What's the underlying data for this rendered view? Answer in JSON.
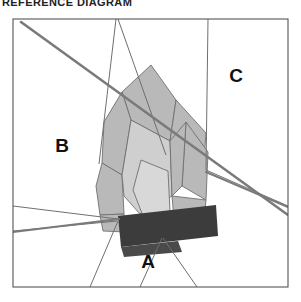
{
  "title": "REFERENCE DIAGRAM",
  "canvas": {
    "width": 301,
    "height": 302
  },
  "frame": {
    "x": 13,
    "y": 19,
    "width": 275,
    "height": 268,
    "stroke": "#555555",
    "stroke_width": 1.1,
    "fill": "#ffffff"
  },
  "colors": {
    "background": "#ffffff",
    "frame_stroke": "#555555",
    "thin_line": "#6f6f6f",
    "heavy_line": "#7a7a7a",
    "polygon_mid_gray": "#b9b9b9",
    "polygon_light_gray": "#d8d8d8",
    "polygon_pale_gray": "#cfcfcf",
    "band_dark": "#3c3c3c",
    "band_dark_alt": "#4a4a4a",
    "label_text": "#111111",
    "title_text": "#222222"
  },
  "labels": [
    {
      "id": "region-a",
      "text": "A",
      "x": 148,
      "y": 268,
      "font_size": 19
    },
    {
      "id": "region-b",
      "text": "B",
      "x": 62,
      "y": 152,
      "font_size": 19
    },
    {
      "id": "region-c",
      "text": "C",
      "x": 236,
      "y": 82,
      "font_size": 19
    }
  ],
  "partition_lines": [
    {
      "id": "divider-upper-right-vertical",
      "points": "208,19 206,170",
      "stroke": "#6f6f6f",
      "width": 1
    },
    {
      "id": "divider-left-mid",
      "points": "13,206 118,219",
      "stroke": "#6f6f6f",
      "width": 1
    },
    {
      "id": "divider-left-lower",
      "points": "13,231 117,221",
      "stroke": "#6f6f6f",
      "width": 1
    },
    {
      "id": "divider-bottom-left-diagonal",
      "points": "118,221 90,287",
      "stroke": "#6f6f6f",
      "width": 1
    },
    {
      "id": "divider-bottom-mid-diagonal",
      "points": "162,238 140,287",
      "stroke": "#6f6f6f",
      "width": 1
    },
    {
      "id": "divider-bottom-right-diagonal",
      "points": "163,238 197,287",
      "stroke": "#6f6f6f",
      "width": 1
    },
    {
      "id": "divider-upper-center-left",
      "points": "116,19 99,164",
      "stroke": "#6f6f6f",
      "width": 1
    },
    {
      "id": "divider-upper-center-right",
      "points": "118,19 166,155",
      "stroke": "#6f6f6f",
      "width": 1
    },
    {
      "id": "divider-right-lower",
      "points": "206,170 288,206",
      "stroke": "#6f6f6f",
      "width": 1
    }
  ],
  "polygons": [
    {
      "id": "shard-top-spire",
      "fill": "#b9b9b9",
      "points": "151,65 176,100 170,141 131,120 122,92"
    },
    {
      "id": "shard-upper-right-wing",
      "fill": "#b9b9b9",
      "points": "176,100 206,133 203,172 170,141"
    },
    {
      "id": "shard-right-tall",
      "fill": "#b9b9b9",
      "points": "186,122 208,152 206,200 182,186"
    },
    {
      "id": "shard-left-mid",
      "fill": "#b9b9b9",
      "points": "122,92 131,120 122,175 102,163 104,122"
    },
    {
      "id": "shard-left-lower",
      "fill": "#b9b9b9",
      "points": "102,163 122,175 124,214 100,215 96,186"
    },
    {
      "id": "shard-center-core",
      "fill": "#cfcfcf",
      "points": "131,120 170,141 172,196 140,214 124,196 122,175"
    },
    {
      "id": "shard-center-bright",
      "fill": "#d8d8d8",
      "points": "141,160 168,171 170,211 143,216 133,190"
    },
    {
      "id": "shard-right-low-wedge",
      "fill": "#b9b9b9",
      "points": "172,196 206,200 204,221 174,219"
    },
    {
      "id": "shard-lower-left-foot",
      "fill": "#b9b9b9",
      "points": "100,215 124,214 126,232 103,231"
    },
    {
      "id": "shard-mid-right-sliver",
      "fill": "#b9b9b9",
      "points": "170,141 186,122 182,186 172,196"
    }
  ],
  "band": {
    "id": "dark-horizontal-band",
    "fill": "#3c3c3c",
    "points": "118,216 216,205 218,236 121,247",
    "second_id": "dark-band-lower-tail",
    "second_fill": "#4a4a4a",
    "second_points": "121,247 178,241 182,252 124,257"
  },
  "heavy_lines": [
    {
      "id": "main-diagonal",
      "x1": 21,
      "y1": 22,
      "x2": 288,
      "y2": 215,
      "stroke": "#7a7a7a",
      "width": 2.6
    },
    {
      "id": "lower-left-connector",
      "x1": 13,
      "y1": 232,
      "x2": 119,
      "y2": 219,
      "stroke": "#7a7a7a",
      "width": 2.0
    },
    {
      "id": "right-lower-connector",
      "x1": 206,
      "y1": 172,
      "x2": 288,
      "y2": 207,
      "stroke": "#7a7a7a",
      "width": 2.0
    }
  ],
  "diagram_meta": {
    "type": "geometric-partition",
    "region_count": 3,
    "shard_count": 10
  }
}
